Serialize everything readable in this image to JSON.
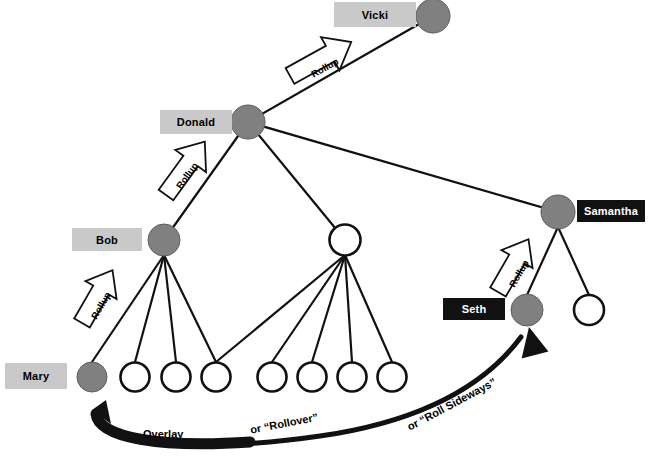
{
  "diagram": {
    "colors": {
      "node_filled": "#808080",
      "node_empty": "#ffffff",
      "node_stroke": "#111111",
      "label_light_bg": "#c9c9c9",
      "label_dark_bg": "#111111",
      "label_light_text": "#000000",
      "label_dark_text": "#ffffff",
      "edge": "#111111",
      "arrow_outline": "#ffffff",
      "arrow_solid": "#111111"
    },
    "nodes": [
      {
        "id": "vicki",
        "label": "Vicki",
        "label_style": "light",
        "fill": "filled",
        "cx": 433,
        "cy": 16,
        "r": 17
      },
      {
        "id": "donald",
        "label": "Donald",
        "label_style": "light",
        "fill": "filled",
        "cx": 248,
        "cy": 122,
        "r": 17
      },
      {
        "id": "bob",
        "label": "Bob",
        "label_style": "light",
        "fill": "filled",
        "cx": 164,
        "cy": 240,
        "r": 16
      },
      {
        "id": "mid",
        "label": "",
        "label_style": "none",
        "fill": "empty",
        "cx": 345,
        "cy": 240,
        "r": 16
      },
      {
        "id": "samantha",
        "label": "Samantha",
        "label_style": "dark",
        "fill": "filled",
        "cx": 558,
        "cy": 212,
        "r": 17
      },
      {
        "id": "seth",
        "label": "Seth",
        "label_style": "dark",
        "fill": "filled",
        "cx": 527,
        "cy": 310,
        "r": 16
      },
      {
        "id": "sam2",
        "label": "",
        "label_style": "none",
        "fill": "empty",
        "cx": 589,
        "cy": 310,
        "r": 16
      },
      {
        "id": "mary",
        "label": "Mary",
        "label_style": "light",
        "fill": "filled",
        "cx": 92,
        "cy": 377,
        "r": 15
      },
      {
        "id": "b2",
        "label": "",
        "label_style": "none",
        "fill": "empty",
        "cx": 135,
        "cy": 377,
        "r": 15
      },
      {
        "id": "b3",
        "label": "",
        "label_style": "none",
        "fill": "empty",
        "cx": 176,
        "cy": 377,
        "r": 15
      },
      {
        "id": "b4",
        "label": "",
        "label_style": "none",
        "fill": "empty",
        "cx": 216,
        "cy": 377,
        "r": 15
      },
      {
        "id": "m1",
        "label": "",
        "label_style": "none",
        "fill": "empty",
        "cx": 272,
        "cy": 377,
        "r": 15
      },
      {
        "id": "m2",
        "label": "",
        "label_style": "none",
        "fill": "empty",
        "cx": 312,
        "cy": 377,
        "r": 15
      },
      {
        "id": "m3",
        "label": "",
        "label_style": "none",
        "fill": "empty",
        "cx": 352,
        "cy": 377,
        "r": 15
      },
      {
        "id": "m4",
        "label": "",
        "label_style": "none",
        "fill": "empty",
        "cx": 392,
        "cy": 377,
        "r": 15
      }
    ],
    "label_boxes": [
      {
        "for": "vicki",
        "text": "Vicki",
        "style": "light",
        "x": 334,
        "y": 2,
        "w": 82,
        "h": 25
      },
      {
        "for": "donald",
        "text": "Donald",
        "style": "light",
        "x": 160,
        "y": 110,
        "w": 72,
        "h": 24
      },
      {
        "for": "bob",
        "text": "Bob",
        "style": "light",
        "x": 72,
        "y": 228,
        "w": 70,
        "h": 23
      },
      {
        "for": "samantha",
        "text": "Samantha",
        "style": "dark",
        "x": 577,
        "y": 200,
        "w": 68,
        "h": 22
      },
      {
        "for": "seth",
        "text": "Seth",
        "style": "dark",
        "x": 443,
        "y": 298,
        "w": 62,
        "h": 22
      },
      {
        "for": "mary",
        "text": "Mary",
        "style": "light",
        "x": 5,
        "y": 363,
        "w": 62,
        "h": 26
      }
    ],
    "edges": [
      {
        "from": "donald",
        "to": "vicki"
      },
      {
        "from": "donald",
        "to": "bob"
      },
      {
        "from": "donald",
        "to": "mid"
      },
      {
        "from": "donald",
        "to": "samantha"
      },
      {
        "from": "bob",
        "to": "mary"
      },
      {
        "from": "bob",
        "to": "b2"
      },
      {
        "from": "bob",
        "to": "b3"
      },
      {
        "from": "bob",
        "to": "b4"
      },
      {
        "from": "mid",
        "to": "b4"
      },
      {
        "from": "mid",
        "to": "m1"
      },
      {
        "from": "mid",
        "to": "m2"
      },
      {
        "from": "mid",
        "to": "m3"
      },
      {
        "from": "mid",
        "to": "m4"
      },
      {
        "from": "samantha",
        "to": "seth"
      },
      {
        "from": "samantha",
        "to": "sam2"
      }
    ],
    "rollup_arrows": [
      {
        "id": "rollup-donald-vicki",
        "label": "Rollup",
        "x": 335,
        "y": 58,
        "angle": -28
      },
      {
        "id": "rollup-bob-donald",
        "label": "Rollup",
        "x": 192,
        "y": 172,
        "angle": -55
      },
      {
        "id": "rollup-mary-bob",
        "label": "Rollup",
        "x": 104,
        "y": 296,
        "angle": -62
      },
      {
        "id": "rollup-seth-sam",
        "label": "Rollup",
        "x": 521,
        "y": 264,
        "angle": -62
      }
    ],
    "flow_labels": [
      {
        "id": "overlay-label",
        "text": "Overlay",
        "x": 143,
        "y": 430,
        "angle": 0
      },
      {
        "id": "rollover-label",
        "text": "or “Rollover”",
        "x": 250,
        "y": 420,
        "angle": -12
      },
      {
        "id": "roll-sideways-label",
        "text": "or “Roll Sideways”",
        "x": 407,
        "y": 418,
        "angle": -30
      }
    ],
    "curved_arrow": {
      "id": "overlay-curved-arrow",
      "description": "thick black curved arrow sweeping from lower-left up to the right toward Seth"
    }
  }
}
